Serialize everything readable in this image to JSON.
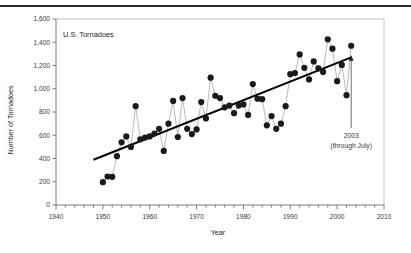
{
  "figure": {
    "has_top_rule": true,
    "background_color": "#ffffff"
  },
  "chart_data": {
    "type": "scatter",
    "title": "U.S. Tornadoes",
    "xlabel": "Year",
    "ylabel": "Number of Tornadoes",
    "xlim": [
      1940,
      2010
    ],
    "ylim": [
      0,
      1600
    ],
    "xticks": [
      1940,
      1950,
      1960,
      1970,
      1980,
      1990,
      2000,
      2010
    ],
    "xtick_labels": [
      "1940",
      "1950",
      "1960",
      "1970",
      "1980",
      "1990",
      "2000",
      "2010"
    ],
    "yticks": [
      0,
      200,
      400,
      600,
      800,
      1000,
      1200,
      1400,
      1600
    ],
    "ytick_labels": [
      "0",
      "200",
      "400",
      "600",
      "800",
      "1,000",
      "1,200",
      "1,400",
      "1,600"
    ],
    "minor_tick_interval_x": 2,
    "grid": false,
    "legend": "none",
    "marker_color": "#1a1a1a",
    "connector_color": "#9a9a9a",
    "trendline_color": "#000000",
    "frame_color": "#b9b9b9",
    "x": [
      1950,
      1951,
      1952,
      1953,
      1954,
      1955,
      1956,
      1957,
      1958,
      1959,
      1960,
      1961,
      1962,
      1963,
      1964,
      1965,
      1966,
      1967,
      1968,
      1969,
      1970,
      1971,
      1972,
      1973,
      1974,
      1975,
      1976,
      1977,
      1978,
      1979,
      1980,
      1981,
      1982,
      1983,
      1984,
      1985,
      1986,
      1987,
      1988,
      1989,
      1990,
      1991,
      1992,
      1993,
      1994,
      1995,
      1996,
      1997,
      1998,
      1999,
      2000,
      2001,
      2002,
      2003
    ],
    "values": [
      196,
      245,
      242,
      420,
      540,
      590,
      500,
      850,
      565,
      580,
      590,
      615,
      655,
      465,
      700,
      895,
      585,
      920,
      655,
      610,
      650,
      885,
      745,
      1095,
      940,
      920,
      840,
      855,
      790,
      855,
      865,
      775,
      1040,
      915,
      910,
      685,
      765,
      655,
      700,
      850,
      1125,
      1135,
      1295,
      1180,
      1080,
      1235,
      1175,
      1145,
      1425,
      1345,
      1065,
      1205,
      945,
      1370
    ],
    "trendline": {
      "x_start": 1948,
      "y_start": 390,
      "x_end": 2003,
      "y_end": 1270
    },
    "annotation": {
      "line1": "2003",
      "line2": "(through July)",
      "arrow": "up",
      "points_to_year": 2003
    }
  }
}
